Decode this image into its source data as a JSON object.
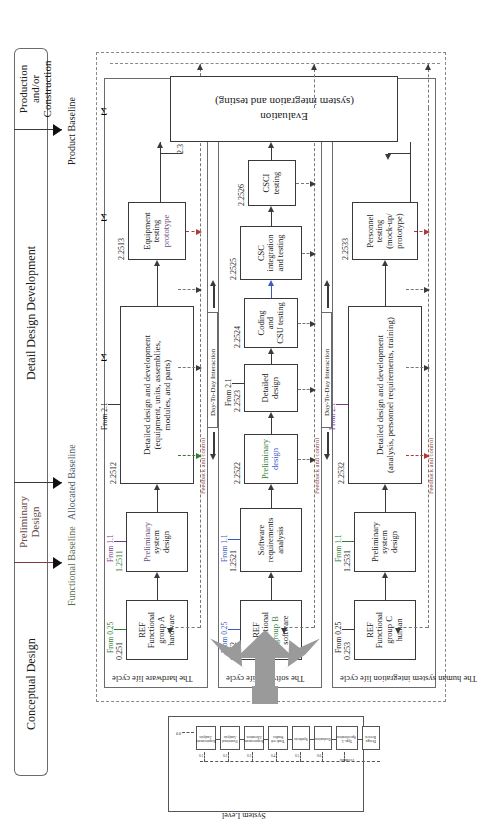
{
  "figure": {
    "title_phases": [
      "Conceptual Design",
      "Preliminary Design",
      "Detail Design Development",
      "Production and/or Construction"
    ],
    "baselines": [
      "Functional Baseline",
      "Allocated Baseline",
      "Product Baseline"
    ],
    "sigma_symbol": "Σ"
  },
  "lanes": [
    {
      "name": "hardware",
      "label": "The hardware life cycle"
    },
    {
      "name": "software",
      "label": "The software life cycle"
    },
    {
      "name": "human",
      "label": "The human system integration life cycle"
    }
  ],
  "interaction_labels": {
    "day_to_day": "Day-To-Day Interaction",
    "feedback": "Feedback and control"
  },
  "hardware_row": {
    "ref_box": {
      "id": "0.251",
      "lines": [
        "REF",
        "Functional",
        "group A",
        "hardware"
      ],
      "from": "From 0.25"
    },
    "prelim": {
      "id": "1.2511",
      "lines": [
        "Preliminary",
        "system",
        "design"
      ],
      "from": "From 1.1"
    },
    "detail": {
      "id": "2.2512",
      "lines": [
        "Detailed design and development",
        "(equipment, units, assemblies,",
        "modules, and parts)"
      ],
      "from": "From 2.1"
    },
    "testing": {
      "id": "2.2513",
      "lines": [
        "Equipment",
        "testing",
        "prototype"
      ]
    }
  },
  "software_row": {
    "ref_box": {
      "id": "0.252",
      "lines": [
        "REF",
        "Functional",
        "group B",
        "software"
      ],
      "from": "From 0.25"
    },
    "sra": {
      "id": "1.2521",
      "lines": [
        "Software",
        "requirements",
        "analysis"
      ],
      "from": "From 1.1"
    },
    "prelim": {
      "id": "2.2522",
      "lines": [
        "Preliminary",
        "design"
      ]
    },
    "detailed": {
      "id": "2.2523",
      "lines": [
        "Detailed",
        "design"
      ],
      "from": "From 2.1"
    },
    "coding": {
      "id": "2.2524",
      "lines": [
        "Coding",
        "and",
        "CSU testing"
      ]
    },
    "csc": {
      "id": "2.2525",
      "lines": [
        "CSC",
        "integration",
        "and testing"
      ]
    },
    "csci": {
      "id": "2.2526",
      "lines": [
        "CSCI",
        "testing"
      ]
    }
  },
  "human_row": {
    "ref_box": {
      "id": "0.253",
      "lines": [
        "REF",
        "Functional",
        "group C",
        "human"
      ],
      "from": "From 0.25"
    },
    "prelim": {
      "id": "1.2531",
      "lines": [
        "Preliminary",
        "system",
        "design"
      ],
      "from": "From 1.1"
    },
    "detail": {
      "id": "2.2532",
      "lines": [
        "Detailed design and development",
        "(analysis, personnel requirements, training)"
      ],
      "from": "From 2.1"
    },
    "testing": {
      "id": "2.2533",
      "lines": [
        "Personnel",
        "testing",
        "(mock-up/",
        "prototype)"
      ]
    }
  },
  "evaluation": {
    "id": "2.3",
    "lines": [
      "Evaluation",
      "(system integration and testing)"
    ]
  },
  "inset": {
    "title": "System Level",
    "entry_id": "0.0",
    "steps": [
      {
        "id": "0.1",
        "lines": [
          "Requirements",
          "Analysis"
        ]
      },
      {
        "id": "0.2",
        "lines": [
          "Functional",
          "Analysis"
        ]
      },
      {
        "id": "0.3",
        "lines": [
          "Requirements",
          "Allocation"
        ]
      },
      {
        "id": "0.4",
        "lines": [
          "Trade-off",
          "Studies"
        ]
      },
      {
        "id": "0.5",
        "lines": [
          "Synthesis"
        ]
      },
      {
        "id": "0.6",
        "lines": [
          "Evaluation"
        ]
      },
      {
        "id": "0.7",
        "lines": [
          "Type A Specification"
        ]
      },
      {
        "id": "0.8",
        "lines": [
          "Design Review"
        ]
      }
    ],
    "feedback_label": "Feedback"
  },
  "colors": {
    "line": "#3a3a3a",
    "swimlane": "#6b6b6b",
    "dash_gray": "#777777",
    "dash_red": "#b03a3a",
    "dash_green": "#2e7d32",
    "dash_blue": "#3b5bbf",
    "dash_purple": "#7a3a8f",
    "fan_gray": "#9a9a9a"
  }
}
